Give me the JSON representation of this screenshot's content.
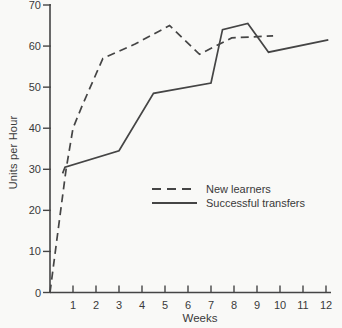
{
  "figure": {
    "background": "#f9f9f7",
    "ink_color": "#454545",
    "text_color": "#3a3a3a"
  },
  "chart_data": {
    "type": "line",
    "title": "",
    "xlabel": "Weeks",
    "ylabel": "Units per Hour",
    "xlim": [
      0,
      12.2
    ],
    "ylim": [
      0,
      70
    ],
    "x_ticks": [
      1,
      2,
      3,
      4,
      5,
      6,
      7,
      8,
      9,
      10,
      11,
      12
    ],
    "y_ticks": [
      0,
      10,
      20,
      30,
      40,
      50,
      60,
      70
    ],
    "grid": false,
    "legend_position": "center-right",
    "legend": [
      {
        "label": "New learners",
        "style": "dashed"
      },
      {
        "label": "Successful transfers",
        "style": "solid"
      }
    ],
    "series": [
      {
        "name": "New learners",
        "style": "dashed",
        "points": [
          [
            0,
            0
          ],
          [
            0.35,
            15
          ],
          [
            0.7,
            30
          ],
          [
            1.0,
            40
          ],
          [
            1.4,
            45.5
          ],
          [
            2.3,
            57
          ],
          [
            3.7,
            60.5
          ],
          [
            5.2,
            65
          ],
          [
            6.5,
            58
          ],
          [
            7.9,
            62
          ],
          [
            9.7,
            62.5
          ]
        ]
      },
      {
        "name": "Successful transfers",
        "style": "solid",
        "points": [
          [
            0.55,
            29
          ],
          [
            0.65,
            30.5
          ],
          [
            3.0,
            34.5
          ],
          [
            4.5,
            48.5
          ],
          [
            7.0,
            51
          ],
          [
            7.5,
            64
          ],
          [
            8.6,
            65.5
          ],
          [
            9.5,
            58.5
          ],
          [
            12.1,
            61.5
          ]
        ]
      }
    ]
  }
}
